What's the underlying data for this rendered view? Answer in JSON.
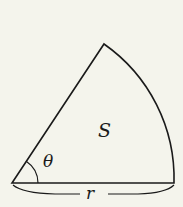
{
  "diagram": {
    "type": "circular-sector",
    "labels": {
      "area": "S",
      "angle": "θ",
      "radius": "r"
    },
    "colors": {
      "background": "#f4f4ec",
      "stroke": "#1a1a1a"
    }
  }
}
